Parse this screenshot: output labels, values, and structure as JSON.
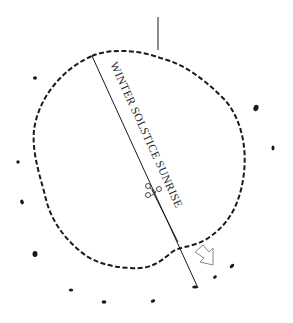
{
  "diagram": {
    "type": "site plan / archaeological alignment sketch",
    "alignment_label": "WINTER SOLSTICE SUNRISE",
    "colors": {
      "background": "#ffffff",
      "ink": "#1a1a1a",
      "arrow_outline": "#888888"
    },
    "elements": {
      "north_marker": "vertical tick line at top",
      "enclosure": "irregular dashed oval boundary",
      "alignment_line": "diagonal line from upper-left of enclosure to lower-right beyond boundary",
      "direction_arrow": "hollow arrow pointing down-right outside the enclosure",
      "stones": "ring of small dark dots outside the enclosure",
      "figure": "small symbol cluster along alignment line"
    },
    "stone_count": 13
  }
}
